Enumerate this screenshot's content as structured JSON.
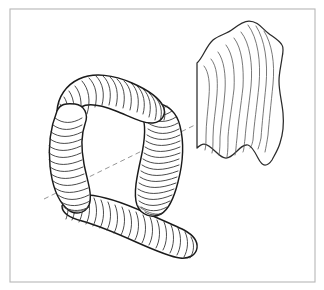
{
  "figure": {
    "title": "Toroidal tube and curved striped surface",
    "canvas": {
      "width": 324,
      "height": 290,
      "background": "#ffffff"
    },
    "frame": {
      "name": "image-border",
      "x": 10,
      "y": 9,
      "width": 305,
      "height": 273,
      "stroke": "#b6b6b6",
      "stroke_width": 1.1
    },
    "palette": {
      "paper": "#ffffff",
      "outline_dark": "#1b1b1b",
      "outline_mid": "#2b2b2b",
      "hatch": "#2a2a2a",
      "hatch_light": "#555555",
      "axis_dashed": "#8a8a8a",
      "frame": "#b6b6b6"
    },
    "objects": [
      {
        "id": "tube-loop",
        "label": "Ribbed toroidal tube loop",
        "description": "Closed bent tube rendered with transverse ring hatching, looping from upper-left around to a lower horizontal run",
        "rib_count": 112,
        "stroke_width": 1.45
      },
      {
        "id": "striped-sheet",
        "label": "Curved striped surface sheet",
        "description": "Wavy quadrilateral membrane with nine longitudinal flow lines and a cusped lower edge",
        "flow_line_count": 9,
        "stroke_width": 1.25
      },
      {
        "id": "symmetry-axis",
        "label": "Dashed symmetry axis",
        "description": "Dashed straight line crossing from lower-left through the tube opening into the sheet",
        "start": [
          44,
          199
        ],
        "end": [
          197,
          124
        ],
        "dash_pattern": "5 3.5"
      }
    ]
  }
}
